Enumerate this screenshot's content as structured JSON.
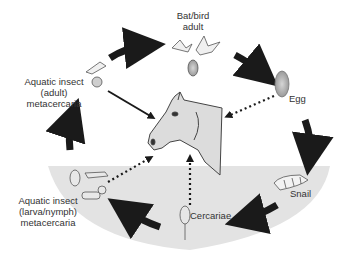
{
  "diagram": {
    "type": "life-cycle",
    "host": "horse",
    "stages": [
      {
        "id": "bat_bird",
        "label_line1": "Bat/bird",
        "label_line2": "adult"
      },
      {
        "id": "egg",
        "label": "Egg"
      },
      {
        "id": "snail",
        "label": "Snail"
      },
      {
        "id": "cercariae",
        "label": "Cercariae"
      },
      {
        "id": "insect_larva",
        "label_line1": "Aquatic insect",
        "label_line2": "(larva/nymph)",
        "label_line3": "metacercaria"
      },
      {
        "id": "insect_adult",
        "label_line1": "Aquatic insect",
        "label_line2": "(adult)",
        "label_line3": "metacercaria"
      }
    ],
    "cycle_arrows": [
      {
        "from": "insect_adult",
        "to": "bat_bird",
        "style": "thick-solid"
      },
      {
        "from": "bat_bird",
        "to": "egg",
        "style": "thick-solid"
      },
      {
        "from": "egg",
        "to": "snail",
        "style": "thick-solid"
      },
      {
        "from": "snail",
        "to": "cercariae",
        "style": "thick-solid"
      },
      {
        "from": "cercariae",
        "to": "insect_larva",
        "style": "thick-solid"
      },
      {
        "from": "insect_larva",
        "to": "insect_adult",
        "style": "thick-solid"
      }
    ],
    "host_arrows": [
      {
        "from": "insect_adult",
        "to": "horse",
        "style": "solid"
      },
      {
        "from": "egg",
        "to": "horse",
        "style": "dotted"
      },
      {
        "from": "cercariae",
        "to": "horse",
        "style": "dotted"
      },
      {
        "from": "insect_larva",
        "to": "horse",
        "style": "dotted"
      }
    ],
    "colors": {
      "water": "#e3e3e3",
      "arrow": "#1a1a1a",
      "text": "#333333",
      "horse_fill": "#dcdcdc"
    }
  }
}
